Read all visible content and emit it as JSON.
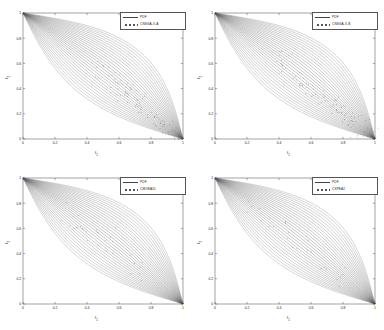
{
  "figure": {
    "background": "#ffffff",
    "layout": "2x2",
    "panel_count": 4
  },
  "chart_data": [
    {
      "type": "line",
      "panel": "top-left",
      "title": "",
      "xlabel": "f1",
      "ylabel": "f2",
      "xlim": [
        0,
        1
      ],
      "ylim": [
        0,
        1
      ],
      "xticks": [
        "0",
        "0.2",
        "0.4",
        "0.6",
        "0.8",
        "1"
      ],
      "yticks": [
        "0",
        "0.2",
        "0.4",
        "0.6",
        "0.8",
        "1"
      ],
      "xtick_values": [
        0,
        0.2,
        0.4,
        0.6,
        0.8,
        1
      ],
      "ytick_values": [
        0,
        0.2,
        0.4,
        0.6,
        0.8,
        1
      ],
      "grid": false,
      "legend_position": "top-right",
      "legend": [
        {
          "label": "PDF",
          "style": "line",
          "color": "#444444"
        },
        {
          "label": "CNSGA-II-A",
          "style": "dots",
          "color": "#555555"
        }
      ],
      "series": [
        {
          "name": "PDF",
          "description": "family of 30 curves fanning from (0,1) to (1,0) forming a lens envelope",
          "curve_count": 30,
          "anchor_start": [
            0,
            1
          ],
          "anchor_end": [
            1,
            0
          ],
          "upper_bulge": 0.3,
          "lower_bulge": -0.2
        },
        {
          "name": "CNSGA-II-A",
          "description": "scattered algorithm solution points, dense along lower-right lobe with outliers beyond envelope",
          "scatter_count": 90,
          "scatter_region": [
            0.45,
            0.05,
            1.0,
            0.6
          ]
        }
      ]
    },
    {
      "type": "line",
      "panel": "top-right",
      "title": "",
      "xlabel": "f1",
      "ylabel": "f2",
      "xlim": [
        0,
        1
      ],
      "ylim": [
        0,
        1
      ],
      "xticks": [
        "0",
        "0.2",
        "0.4",
        "0.6",
        "0.8",
        "1"
      ],
      "yticks": [
        "0",
        "0.2",
        "0.4",
        "0.6",
        "0.8",
        "1"
      ],
      "xtick_values": [
        0,
        0.2,
        0.4,
        0.6,
        0.8,
        1
      ],
      "ytick_values": [
        0,
        0.2,
        0.4,
        0.6,
        0.8,
        1
      ],
      "grid": false,
      "legend_position": "top-right",
      "legend": [
        {
          "label": "PDF",
          "style": "line",
          "color": "#444444"
        },
        {
          "label": "CNSGA-II-B",
          "style": "dots",
          "color": "#555555"
        }
      ],
      "series": [
        {
          "name": "PDF",
          "description": "family of 30 curves fanning from (0,1) to (1,0) forming a lens envelope",
          "curve_count": 30,
          "anchor_start": [
            0,
            1
          ],
          "anchor_end": [
            1,
            0
          ],
          "upper_bulge": 0.3,
          "lower_bulge": -0.2
        },
        {
          "name": "CNSGA-II-B",
          "description": "scattered algorithm solution points, dense along lower-right lobe with outliers beyond envelope",
          "scatter_count": 95,
          "scatter_region": [
            0.4,
            0.05,
            1.0,
            0.65
          ]
        }
      ]
    },
    {
      "type": "line",
      "panel": "bottom-left",
      "title": "",
      "xlabel": "f1",
      "ylabel": "f2",
      "xlim": [
        0,
        1
      ],
      "ylim": [
        0,
        1
      ],
      "xticks": [
        "0",
        "0.2",
        "0.4",
        "0.6",
        "0.8",
        "1"
      ],
      "yticks": [
        "0",
        "0.2",
        "0.4",
        "0.6",
        "0.8",
        "1"
      ],
      "xtick_values": [
        0,
        0.2,
        0.4,
        0.6,
        0.8,
        1
      ],
      "ytick_values": [
        0,
        0.2,
        0.4,
        0.6,
        0.8,
        1
      ],
      "grid": false,
      "legend_position": "top-right",
      "legend": [
        {
          "label": "PDF",
          "style": "line",
          "color": "#444444"
        },
        {
          "label": "CMOEA/D",
          "style": "dots",
          "color": "#555555"
        }
      ],
      "series": [
        {
          "name": "PDF",
          "description": "family of 30 curves fanning from (0,1) to (1,0) forming a lens envelope",
          "curve_count": 30,
          "anchor_start": [
            0,
            1
          ],
          "anchor_end": [
            1,
            0
          ],
          "upper_bulge": 0.3,
          "lower_bulge": -0.2
        },
        {
          "name": "CMOEA/D",
          "description": "sparse solution points confined within the envelope interior",
          "scatter_count": 30,
          "scatter_region": [
            0.25,
            0.35,
            0.8,
            0.8
          ]
        }
      ]
    },
    {
      "type": "line",
      "panel": "bottom-right",
      "title": "",
      "xlabel": "f1",
      "ylabel": "f2",
      "xlim": [
        0,
        1
      ],
      "ylim": [
        0,
        1
      ],
      "xticks": [
        "0",
        "0.2",
        "0.4",
        "0.6",
        "0.8",
        "1"
      ],
      "yticks": [
        "0",
        "0.2",
        "0.4",
        "0.6",
        "0.8",
        "1"
      ],
      "xtick_values": [
        0,
        0.2,
        0.4,
        0.6,
        0.8,
        1
      ],
      "ytick_values": [
        0,
        0.2,
        0.4,
        0.6,
        0.8,
        1
      ],
      "grid": false,
      "legend_position": "top-right",
      "legend": [
        {
          "label": "PDF",
          "style": "line",
          "color": "#444444"
        },
        {
          "label": "CSPEA2",
          "style": "dots",
          "color": "#555555"
        }
      ],
      "series": [
        {
          "name": "PDF",
          "description": "family of 30 curves fanning from (0,1) to (1,0) forming a lens envelope",
          "curve_count": 30,
          "anchor_start": [
            0,
            1
          ],
          "anchor_end": [
            1,
            0
          ],
          "upper_bulge": 0.3,
          "lower_bulge": -0.2
        },
        {
          "name": "CSPEA2",
          "description": "sparse solution points confined within the envelope interior",
          "scatter_count": 28,
          "scatter_region": [
            0.2,
            0.3,
            0.85,
            0.85
          ]
        }
      ]
    }
  ]
}
